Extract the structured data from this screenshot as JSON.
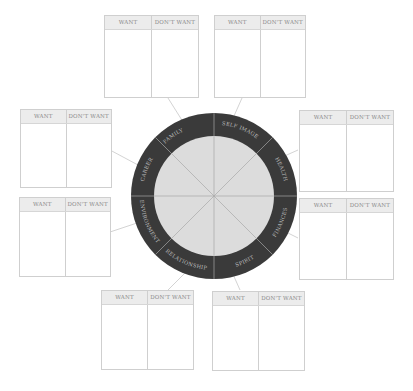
{
  "colors": {
    "ring": "#3a3a3a",
    "inner_circle": "#dcdcdc",
    "divider": "#a8a8a8",
    "ring_text": "#bdbdbd",
    "box_border": "#cfcfcf",
    "box_header": "#ececec",
    "connector": "#c8c8c8"
  },
  "wheel": {
    "segments": [
      {
        "label": "FAMILY"
      },
      {
        "label": "SELF IMAGE"
      },
      {
        "label": "HEALTH"
      },
      {
        "label": "FINANCES"
      },
      {
        "label": "SPIRIT"
      },
      {
        "label": "RELATIONSHIP"
      },
      {
        "label": "ENVIRONMENT"
      },
      {
        "label": "CAREER"
      }
    ]
  },
  "boxes": [
    {
      "position": "top-left",
      "want": "WANT",
      "dont_want": "DON'T WANT"
    },
    {
      "position": "top-right",
      "want": "WANT",
      "dont_want": "DON'T WANT"
    },
    {
      "position": "right-upper",
      "want": "WANT",
      "dont_want": "DON'T WANT"
    },
    {
      "position": "right-lower",
      "want": "WANT",
      "dont_want": "DON'T WANT"
    },
    {
      "position": "bottom-right",
      "want": "WANT",
      "dont_want": "DON'T WANT"
    },
    {
      "position": "bottom-left",
      "want": "WANT",
      "dont_want": "DON'T WANT"
    },
    {
      "position": "left-lower",
      "want": "WANT",
      "dont_want": "DON'T WANT"
    },
    {
      "position": "left-upper",
      "want": "WANT",
      "dont_want": "DON'T WANT"
    }
  ]
}
